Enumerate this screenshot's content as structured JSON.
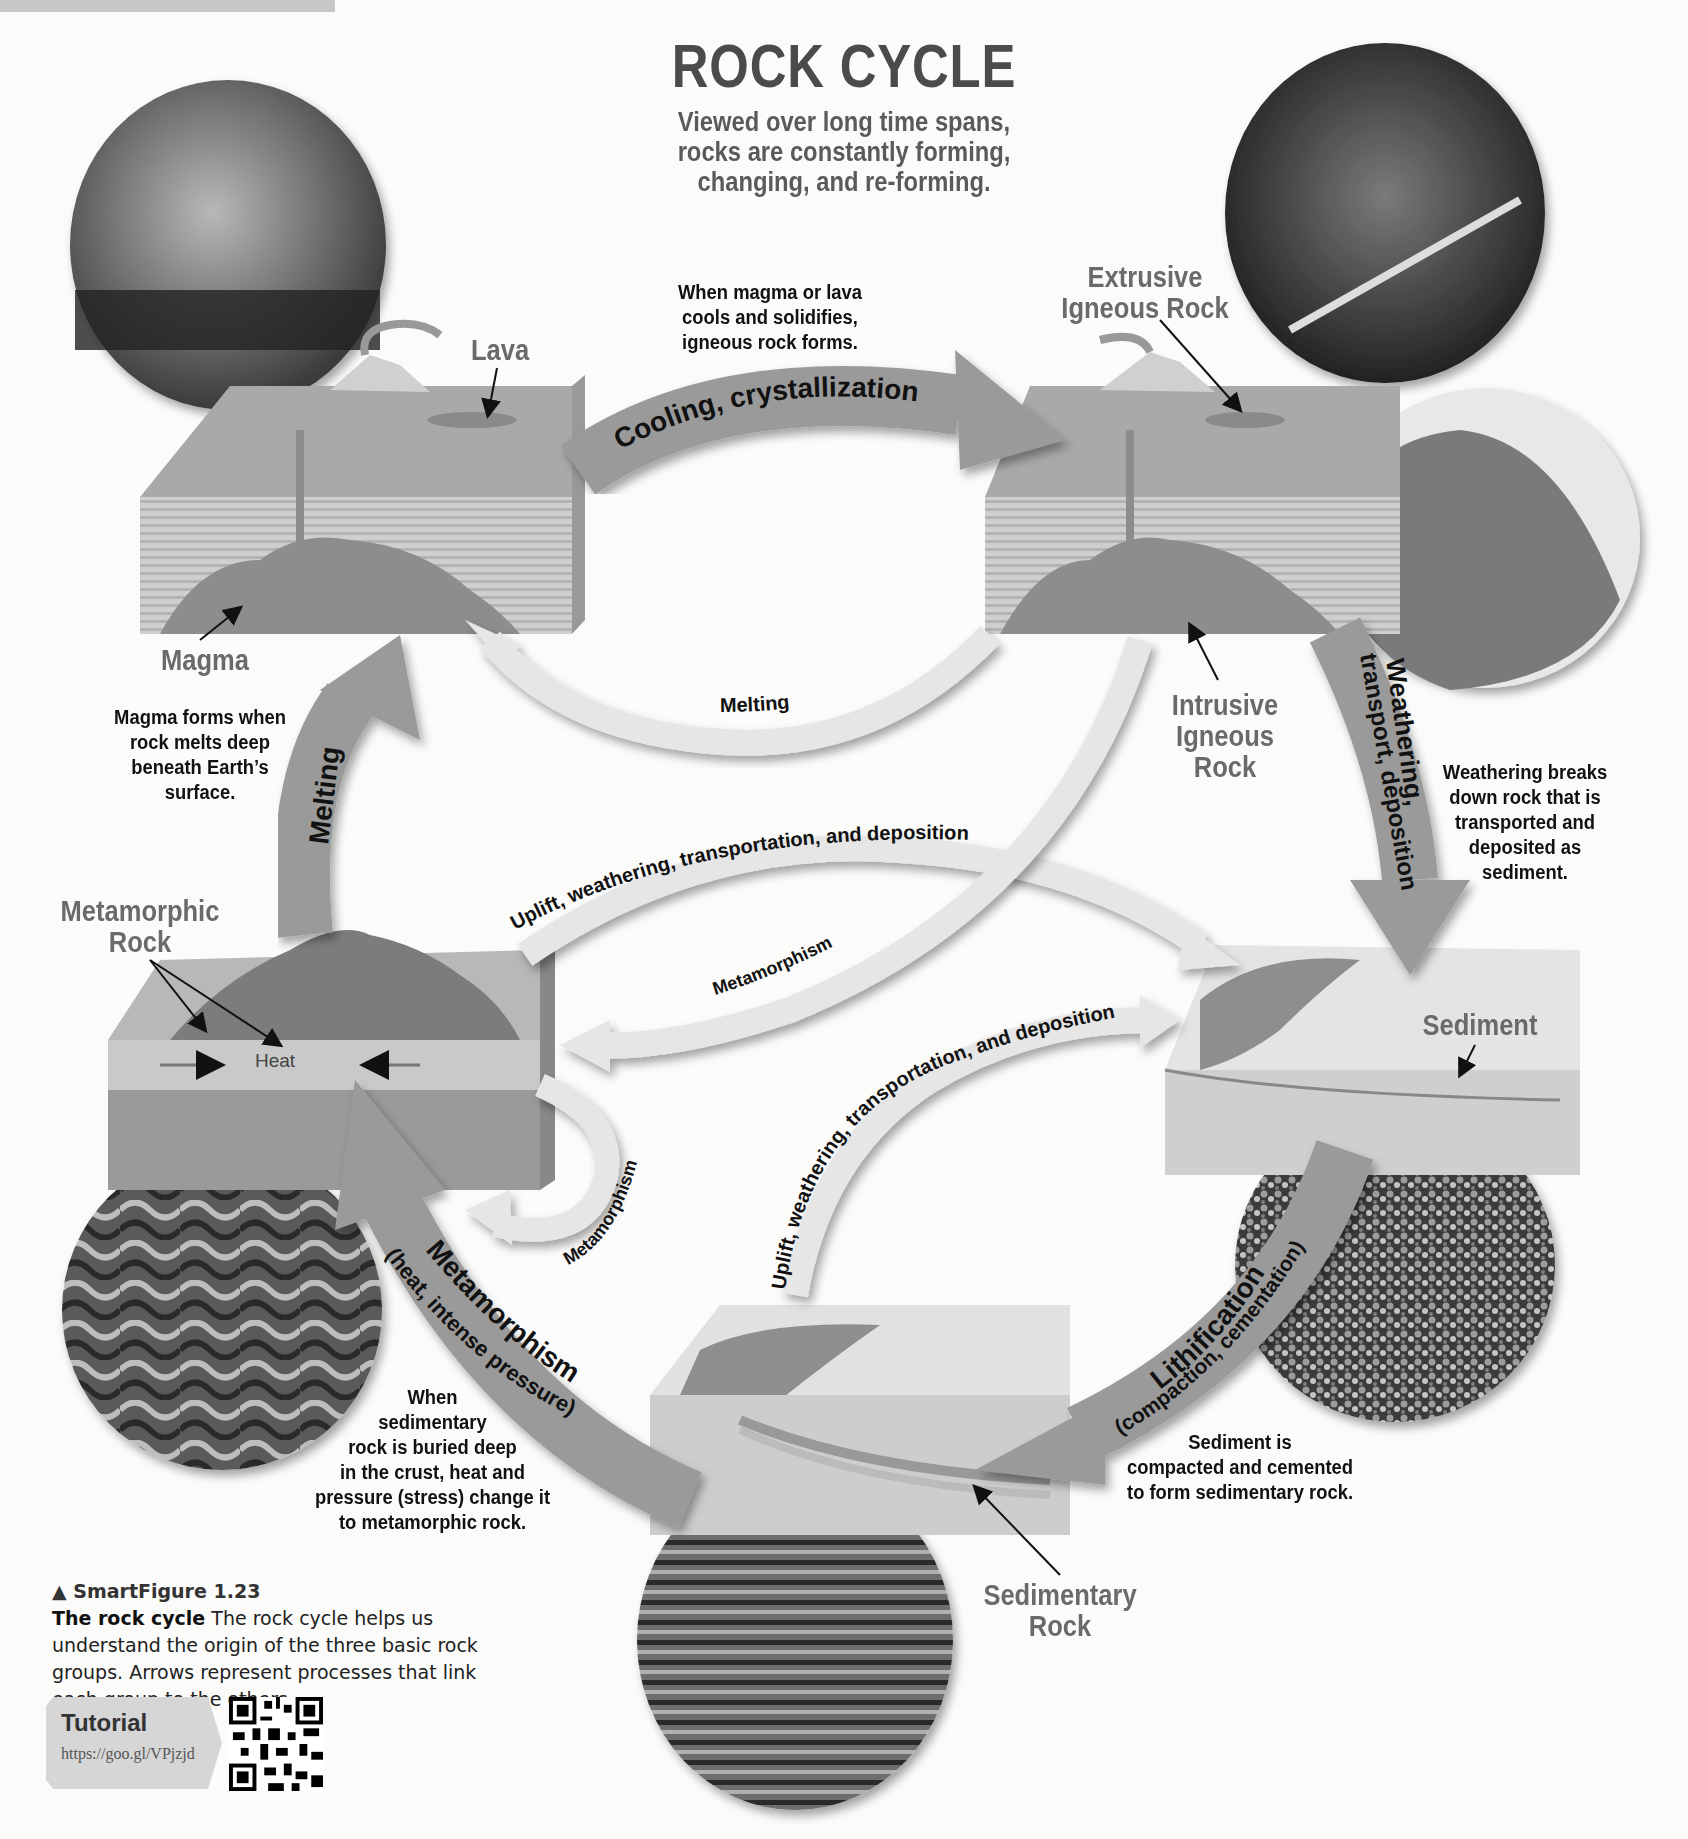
{
  "header": {
    "title": "ROCK CYCLE",
    "subtitle_lines": [
      "Viewed over long time spans,",
      "rocks are constantly forming,",
      "changing, and re-forming."
    ]
  },
  "rock_labels": {
    "lava": "Lava",
    "magma": "Magma",
    "extrusive": [
      "Extrusive",
      "Igneous Rock"
    ],
    "intrusive": [
      "Intrusive",
      "Igneous",
      "Rock"
    ],
    "metamorphic": [
      "Metamorphic",
      "Rock"
    ],
    "sediment": "Sediment",
    "sedimentary": [
      "Sedimentary",
      "Rock"
    ],
    "heat": "Heat"
  },
  "process_arrows": {
    "cooling": "Cooling, crystallization",
    "melting_top": "Melting",
    "melting_left": "Melting",
    "weathering_main": "Weathering,",
    "weathering_sub": "transport, deposition",
    "uplift_upper": "Uplift, weathering, transportation, and deposition",
    "uplift_lower": "Uplift, weathering, transportation, and deposition",
    "metamorphism_center": "Metamorphism",
    "metamorphism_loop": "Metamorphism",
    "metamorphism_main": "Metamorphism",
    "metamorphism_sub": "(heat, intense pressure)",
    "lithification_main": "Lithification",
    "lithification_sub": "(compaction, cementation)"
  },
  "notes": {
    "cooling": [
      "When magma or lava",
      "cools and solidifies,",
      "igneous rock forms."
    ],
    "magma": [
      "Magma forms when",
      "rock melts deep",
      "beneath Earth’s",
      "surface."
    ],
    "weathering": [
      "Weathering breaks",
      "down rock that is",
      "transported and",
      "deposited as",
      "sediment."
    ],
    "metamorphism": [
      "When",
      "sedimentary",
      "rock is buried deep",
      "in the crust, heat and",
      "pressure (stress) change it",
      "to metamorphic rock."
    ],
    "lithification": [
      "Sediment is",
      "compacted and cemented",
      "to form sedimentary rock."
    ]
  },
  "caption": {
    "figure": "▲ SmartFigure 1.23",
    "bold": "The rock cycle",
    "text": "  The rock cycle helps us understand the origin of the three basic rock groups. Arrows represent processes that link each group to the others."
  },
  "tutorial": {
    "label": "Tutorial",
    "url": "https://goo.gl/VPjzjd"
  },
  "colors": {
    "main_arrow": "#9a9a9a",
    "light_arrow": "#e6e6e6",
    "label_gray": "#6a6a6a",
    "background": "#fbfbfa"
  }
}
